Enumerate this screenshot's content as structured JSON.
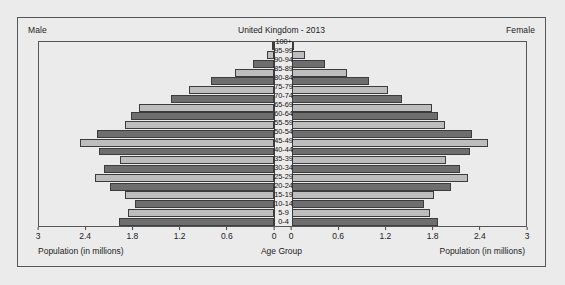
{
  "header": {
    "male_label": "Male",
    "female_label": "Female",
    "title": "United Kingdom - 2013"
  },
  "axis_titles": {
    "left": "Population (in millions)",
    "center": "Age Group",
    "right": "Population (in millions)"
  },
  "colors": {
    "bar_dark": "#6e6e6e",
    "bar_light": "#bdbdbd",
    "bar_outline": "#3c3c3c",
    "frame": "#55565a",
    "background": "#ebebeb"
  },
  "chart_data": {
    "type": "bar",
    "subtype": "population-pyramid",
    "title": "United Kingdom - 2013",
    "xlabel": "Population (in millions)",
    "ylabel": "Age Group",
    "grid": false,
    "legend": "none",
    "xlim_left": [
      3,
      0
    ],
    "xlim_right": [
      0,
      3
    ],
    "left_ticks": [
      "3",
      "2.4",
      "1.8",
      "1.2",
      "0.6",
      "0"
    ],
    "right_ticks": [
      "0",
      "0.6",
      "1.2",
      "1.8",
      "2.4",
      "3"
    ],
    "left_tick_values": [
      3,
      2.4,
      1.8,
      1.2,
      0.6,
      0
    ],
    "right_tick_values": [
      0,
      0.6,
      1.2,
      1.8,
      2.4,
      3
    ],
    "categories": [
      "0-4",
      "5-9",
      "10-14",
      "15-19",
      "20-24",
      "25-29",
      "30-34",
      "35-39",
      "40-44",
      "45-49",
      "50-54",
      "55-59",
      "60-64",
      "65-69",
      "70-74",
      "75-79",
      "80-84",
      "85-89",
      "90-94",
      "95-99",
      "100+"
    ],
    "series": [
      {
        "name": "Male",
        "side": "left",
        "values": [
          1.98,
          1.86,
          1.78,
          1.9,
          2.1,
          2.29,
          2.17,
          1.96,
          2.24,
          2.48,
          2.26,
          1.9,
          1.82,
          1.72,
          1.32,
          1.09,
          0.8,
          0.5,
          0.27,
          0.09,
          0.02
        ]
      },
      {
        "name": "Female",
        "side": "right",
        "values": [
          1.88,
          1.77,
          1.7,
          1.82,
          2.04,
          2.26,
          2.16,
          1.98,
          2.28,
          2.52,
          2.31,
          1.96,
          1.88,
          1.8,
          1.42,
          1.24,
          0.99,
          0.71,
          0.44,
          0.18,
          0.04
        ]
      }
    ]
  }
}
